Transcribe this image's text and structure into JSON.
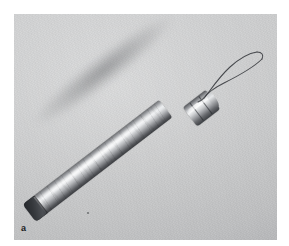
{
  "figure": {
    "panel_label": "a",
    "caption_text": "",
    "background_color": "#c9cacb",
    "page_color": "#ffffff",
    "plate": {
      "left": 14,
      "top": 14,
      "width": 263,
      "height": 226
    }
  },
  "subject": {
    "name": "wire-loop-probe",
    "description": "cylindrical metal probe handle with ferrule and wire loop",
    "orientation_degrees": -37.5,
    "parts": [
      {
        "name": "handle-shaft",
        "label": "handle",
        "material": "brushed metal",
        "color_light": "#eceef0",
        "color_dark": "#3b3d41"
      },
      {
        "name": "handle-endcap",
        "label": "end cap",
        "material": "dark metal",
        "color_light": "#4c4f54",
        "color_dark": "#24262a"
      },
      {
        "name": "ferrule",
        "label": "ferrule",
        "material": "polished metal",
        "color_light": "#f2f3f4",
        "color_dark": "#3d4044"
      },
      {
        "name": "wire-loop",
        "label": "wire loop",
        "material": "spring steel wire",
        "color": "#3c3e42"
      }
    ]
  },
  "artifacts": {
    "dust_speck": {
      "label": "dust speck",
      "x": 73,
      "y": 198
    }
  }
}
